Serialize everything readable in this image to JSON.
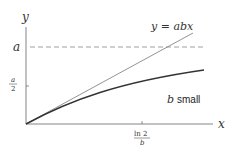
{
  "diagram": {
    "axes": {
      "x_label": "x",
      "y_label": "y"
    },
    "y_ticks": [
      {
        "label_num": "a",
        "label_den": "",
        "kind": "a-level"
      },
      {
        "label_num": "a",
        "label_den": "2",
        "kind": "half-a"
      }
    ],
    "x_ticks": [
      {
        "label_num": "ln 2",
        "label_den": "b"
      }
    ],
    "annotations": {
      "line_label": "y = abx",
      "curve_label_var": "b",
      "curve_label_text": "small"
    },
    "elements": {
      "asymptote": "dashed horizontal line at y = a",
      "tangent_line": "straight line y = abx",
      "curve": "saturating curve for small b"
    },
    "colors": {
      "axis": "#555555",
      "line": "#777777",
      "curve": "#333333",
      "dashed": "#888888",
      "text": "#333333"
    }
  }
}
